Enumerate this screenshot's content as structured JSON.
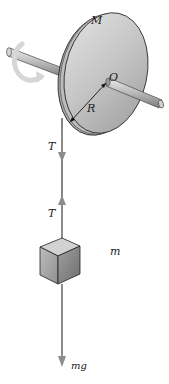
{
  "diagram": {
    "labels": {
      "disc_mass": "M",
      "center": "O",
      "radius": "R",
      "tension_top": "T",
      "tension_bottom": "T",
      "block_mass": "m",
      "weight": "mg"
    },
    "elements": [
      "disc",
      "axle",
      "rotation-arrow",
      "rope",
      "tension-arrow-down",
      "tension-arrow-up",
      "block",
      "weight-arrow"
    ],
    "colors": {
      "disc_face": "#c8c8c8",
      "disc_edge": "#9a9a9a",
      "outline": "#222222",
      "arrow": "#8c8c8c",
      "rotation_arrow": "#d8d8d8",
      "block_front": "#a8a8a8",
      "block_side": "#8a8a8a",
      "block_top": "#cfcfcf"
    }
  }
}
